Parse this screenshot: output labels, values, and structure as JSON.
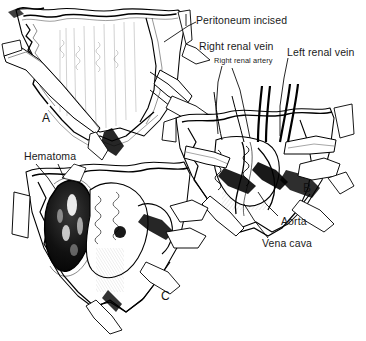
{
  "figure": {
    "domain": "medical-surgical-line-illustration",
    "background_color": "#ffffff",
    "ink_color": "#000000",
    "width": 366,
    "height": 341,
    "panel_count": 3
  },
  "labels": {
    "peritoneum_incised": "Peritoneum incised",
    "right_renal_vein": "Right renal vein",
    "right_renal_artery": "Right renal artery",
    "left_renal_vein": "Left renal vein",
    "aorta": "Aorta",
    "vena_cava": "Vena cava",
    "hematoma": "Hematoma"
  },
  "panels": [
    {
      "letter": "A",
      "description": "Midline retroperitoneal exposure with peritoneum incised, V-shaped wound edges retracted",
      "labels": [
        "Peritoneum incised"
      ]
    },
    {
      "letter": "B",
      "description": "Great vessels exposed showing renal vessels, aorta and vena cava",
      "labels": [
        "Right renal vein",
        "Right renal artery",
        "Left renal vein",
        "Aorta",
        "Vena cava"
      ]
    },
    {
      "letter": "C",
      "description": "Large retroperitoneal hematoma displacing structures",
      "labels": [
        "Hematoma"
      ]
    }
  ]
}
